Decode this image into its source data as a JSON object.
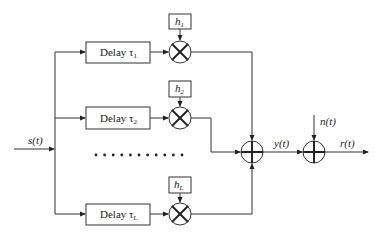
{
  "diagram": {
    "input": {
      "label": "s(t)"
    },
    "branches": [
      {
        "delay_label": "Delay τ",
        "delay_sub": "1",
        "gain_label": "h",
        "gain_sub": "1"
      },
      {
        "delay_label": "Delay τ",
        "delay_sub": "2",
        "gain_label": "h",
        "gain_sub": "2"
      },
      {
        "delay_label": "Delay τ",
        "delay_sub": "L",
        "gain_label": "h",
        "gain_sub": "L"
      }
    ],
    "ellipsis_dots": 11,
    "sum_output": {
      "label": "y(t)"
    },
    "noise": {
      "label": "n(t)"
    },
    "output": {
      "label": "r(t)"
    }
  }
}
